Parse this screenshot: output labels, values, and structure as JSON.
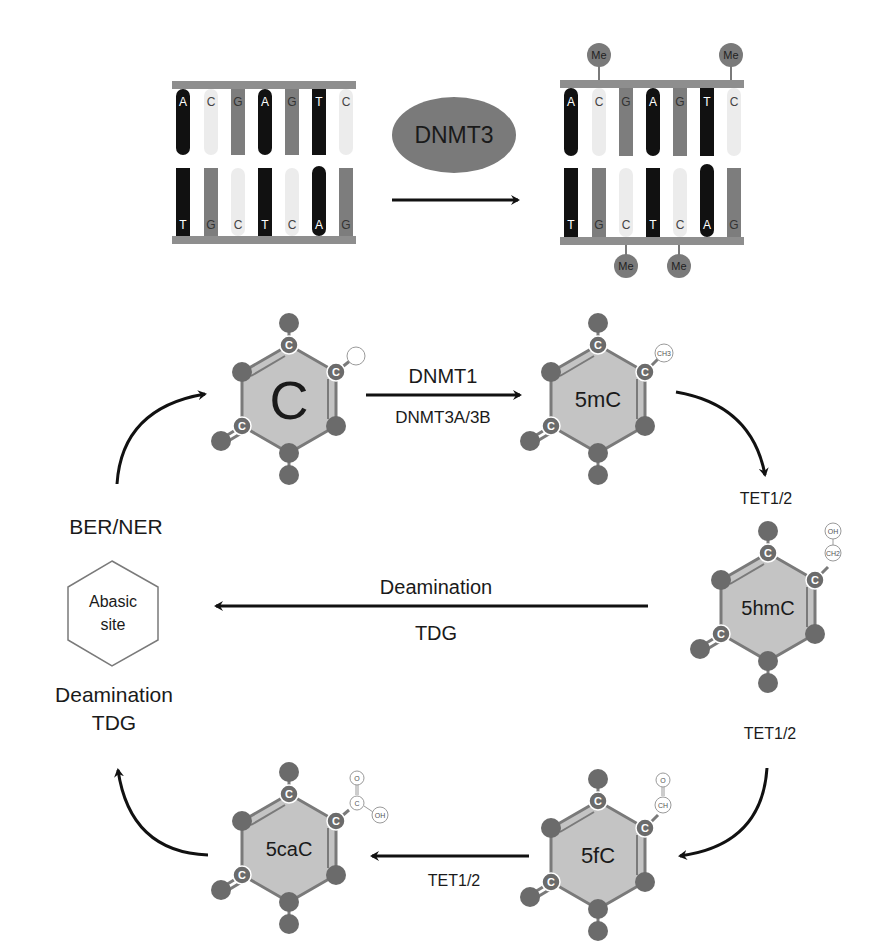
{
  "colors": {
    "black_base": "#111111",
    "dark_base": "#7d7d7d",
    "light_base": "#ececec",
    "strand": "#8e8e8e",
    "ring_fill": "#c4c4c4",
    "atom": "#6b6b6b",
    "enzyme_ellipse": "#7a7a7a"
  },
  "top_panel": {
    "enzyme": "DNMT3",
    "left_dna": {
      "top_bases": [
        "A",
        "C",
        "G",
        "A",
        "G",
        "T",
        "C"
      ],
      "bottom_bases": [
        "T",
        "G",
        "C",
        "T",
        "C",
        "A",
        "G"
      ]
    },
    "right_dna": {
      "top_bases": [
        "A",
        "C",
        "G",
        "A",
        "G",
        "T",
        "C"
      ],
      "bottom_bases": [
        "T",
        "G",
        "C",
        "T",
        "C",
        "A",
        "G"
      ],
      "methyl_label": "Me",
      "methyl_top_positions": [
        2,
        7
      ],
      "methyl_bottom_positions": [
        3,
        5
      ]
    }
  },
  "cycle": {
    "molecules": {
      "c": {
        "label": "C",
        "substituent": ""
      },
      "mc": {
        "label": "5mC",
        "substituent": "CH3"
      },
      "hmc": {
        "label": "5hmC",
        "substituent_top": "OH",
        "substituent_bottom": "CH2"
      },
      "fc": {
        "label": "5fC",
        "substituent_top": "O",
        "substituent_bottom": "CH"
      },
      "cac": {
        "label": "5caC",
        "substituent_top": "O",
        "substituent_mid": "C",
        "substituent_side": "OH"
      },
      "abasic": {
        "line1": "Abasic",
        "line2": "site"
      }
    },
    "ring_atom_label": "C",
    "steps": {
      "c_to_5mc_top": "DNMT1",
      "c_to_5mc_bottom": "DNMT3A/3B",
      "5mc_to_5hmc": "TET1/2",
      "5hmc_to_abasic_top": "Deamination",
      "5hmc_to_abasic_bottom": "TDG",
      "5hmc_to_5fc": "TET1/2",
      "5fc_to_5cac": "TET1/2",
      "5cac_to_abasic_line1": "Deamination",
      "5cac_to_abasic_line2": "TDG",
      "abasic_to_c": "BER/NER"
    }
  }
}
